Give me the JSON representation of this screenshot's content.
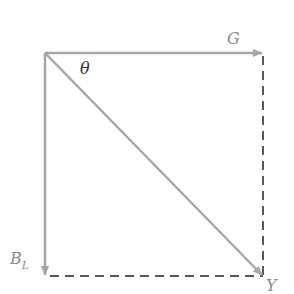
{
  "diagram": {
    "type": "vector-decomposition",
    "labels": {
      "g": "G",
      "b_main": "B",
      "b_sub": "L",
      "y": "Y",
      "theta": "θ"
    },
    "colors": {
      "vector": "#a6a6a6",
      "dashed": "#222222",
      "label": "#8a8a8a",
      "angle": "#333333"
    },
    "geometry": {
      "origin": [
        45,
        53
      ],
      "g_tip": [
        263,
        53
      ],
      "bl_tip": [
        45,
        276
      ],
      "y_tip": [
        263,
        276
      ]
    }
  }
}
